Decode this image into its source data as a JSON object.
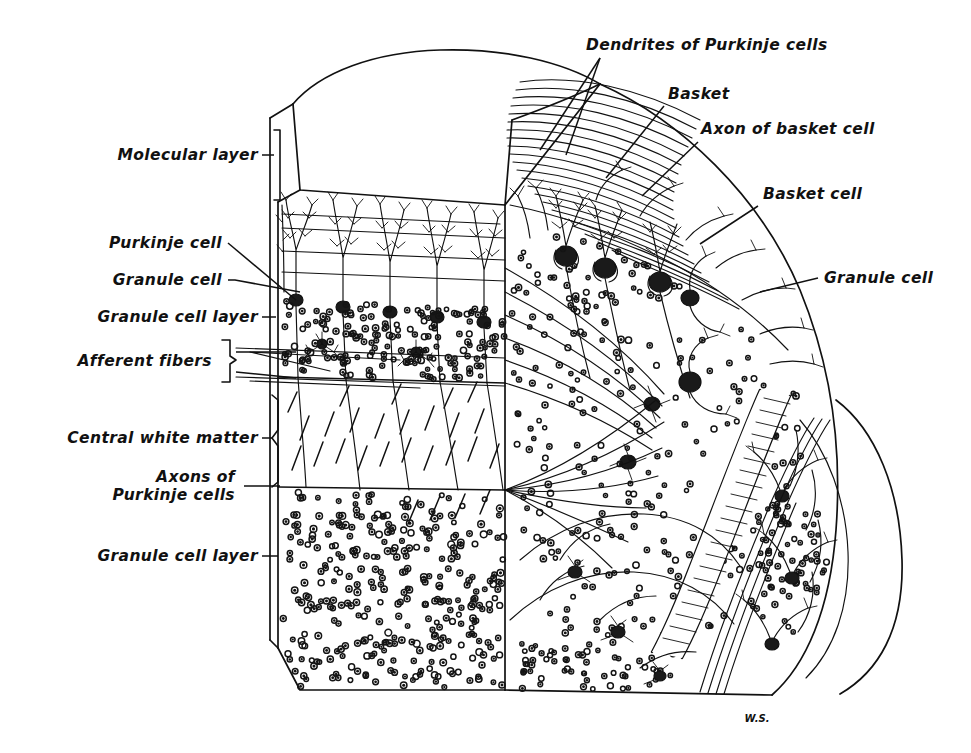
{
  "figure": {
    "signature": "W.S.",
    "ink_color": "#111111",
    "background_color": "#ffffff"
  },
  "labels_left": [
    {
      "id": "molecular-layer",
      "text": "Molecular layer",
      "x": 258,
      "y": 160,
      "lines": [
        "Molecular layer"
      ]
    },
    {
      "id": "purkinje-cell",
      "text": "Purkinje cell",
      "x": 222,
      "y": 248,
      "lines": [
        "Purkinje cell"
      ]
    },
    {
      "id": "granule-cell-left",
      "text": "Granule cell",
      "x": 222,
      "y": 285,
      "lines": [
        "Granule cell"
      ]
    },
    {
      "id": "granule-cell-layer-upper",
      "text": "Granule cell layer",
      "x": 258,
      "y": 322,
      "lines": [
        "Granule cell layer"
      ]
    },
    {
      "id": "afferent-fibers",
      "text": "Afferent fibers",
      "x": 212,
      "y": 366,
      "lines": [
        "Afferent fibers"
      ]
    },
    {
      "id": "central-white-matter",
      "text": "Central white matter",
      "x": 258,
      "y": 443,
      "lines": [
        "Central white matter"
      ]
    },
    {
      "id": "axons-of-purkinje-cells",
      "text": "Axons of Purkinje cells",
      "x": 235,
      "y": 482,
      "lines": [
        "Axons of",
        "Purkinje cells"
      ]
    },
    {
      "id": "granule-cell-layer-lower",
      "text": "Granule cell layer",
      "x": 258,
      "y": 561,
      "lines": [
        "Granule cell layer"
      ]
    }
  ],
  "labels_right": [
    {
      "id": "dendrites-of-purkinje-cells",
      "text": "Dendrites of Purkinje cells",
      "x": 586,
      "y": 50,
      "lines": [
        "Dendrites of Purkinje cells"
      ]
    },
    {
      "id": "basket",
      "text": "Basket",
      "x": 668,
      "y": 99,
      "lines": [
        "Basket"
      ]
    },
    {
      "id": "axon-of-basket-cell",
      "text": "Axon of basket cell",
      "x": 701,
      "y": 134,
      "lines": [
        "Axon of basket cell"
      ]
    },
    {
      "id": "basket-cell",
      "text": "Basket cell",
      "x": 763,
      "y": 199,
      "lines": [
        "Basket cell"
      ]
    },
    {
      "id": "granule-cell-right",
      "text": "Granule cell",
      "x": 824,
      "y": 283,
      "lines": [
        "Granule cell"
      ]
    }
  ],
  "structures": {
    "molecular_layer": "Outer layer containing Purkinje dendritic arbors, parallel fibers and basket cells",
    "granule_cell_layer": "Densely packed small granule cells shown as ringed dots",
    "central_white_matter": "Hatched band of myelinated fibers",
    "purkinje_cells_top_count": 6,
    "basket_cells_count": 7,
    "parallel_fibers_count": 22
  }
}
